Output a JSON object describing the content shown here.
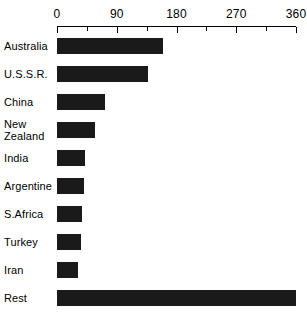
{
  "chart_data": {
    "type": "bar",
    "orientation": "horizontal",
    "title": "",
    "xlabel": "",
    "ylabel": "",
    "xlim": [
      0,
      360
    ],
    "grid": false,
    "legend": null,
    "axis_ticks_major": [
      0,
      90,
      180,
      270,
      360
    ],
    "axis_tick_labels": [
      "0",
      "90",
      "180",
      "270",
      "360"
    ],
    "axis_ticks_minor": [
      45,
      135,
      225,
      315
    ],
    "categories": [
      "Australia",
      "U.S.S.R.",
      "China",
      "New\nZealand",
      "India",
      "Argentine",
      "S.Africa",
      "Turkey",
      "Iran",
      "Rest"
    ],
    "values": [
      160,
      137,
      72,
      57,
      42,
      40,
      37,
      36,
      31,
      360
    ],
    "bar_color": "#1a1a1a",
    "background_color": "#ffffff",
    "axis_color": "#000000"
  }
}
